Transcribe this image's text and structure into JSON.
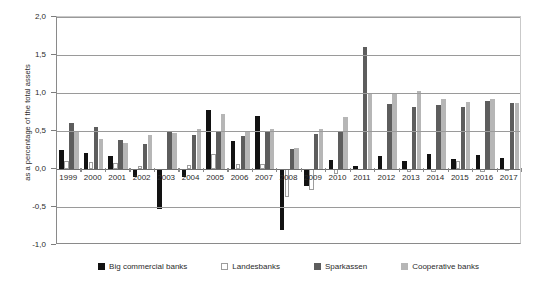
{
  "chart_data": {
    "type": "bar",
    "title": "",
    "subtitle": "",
    "xlabel": "",
    "ylabel": "as a percentage of the total assets",
    "ylim": [
      -1.0,
      2.0
    ],
    "ytick_labels": [
      "2,0",
      "1,5",
      "1,0",
      "0,5",
      "0,0",
      "-0,5",
      "-1,0"
    ],
    "ytick_values": [
      2.0,
      1.5,
      1.0,
      0.5,
      0.0,
      -0.5,
      -1.0
    ],
    "grid": true,
    "legend_position": "bottom",
    "categories": [
      "1999",
      "2000",
      "2001",
      "2002",
      "2003",
      "2004",
      "2005",
      "2006",
      "2007",
      "2008",
      "2009",
      "2010",
      "2011",
      "2012",
      "2013",
      "2014",
      "2015",
      "2016",
      "2017"
    ],
    "series": [
      {
        "name": "Big commercial banks",
        "color": "#121212",
        "values": [
          0.25,
          0.21,
          0.17,
          -0.1,
          -0.52,
          -0.11,
          0.78,
          0.37,
          0.7,
          -0.8,
          -0.22,
          0.12,
          0.04,
          0.17,
          0.1,
          0.2,
          0.13,
          0.18,
          0.15
        ]
      },
      {
        "name": "Landesbanks",
        "color": "#ffffff",
        "values": [
          0.1,
          0.09,
          0.08,
          0.04,
          0.0,
          0.05,
          0.2,
          0.07,
          0.06,
          -0.37,
          -0.27,
          -0.06,
          0.0,
          0.0,
          -0.04,
          -0.04,
          0.1,
          -0.04,
          -0.02
        ]
      },
      {
        "name": "Sparkassen",
        "color": "#5d5d5d",
        "values": [
          0.6,
          0.55,
          0.38,
          0.33,
          0.5,
          0.45,
          0.5,
          0.43,
          0.5,
          0.26,
          0.46,
          0.5,
          1.6,
          0.86,
          0.82,
          0.84,
          0.82,
          0.89,
          0.87
        ]
      },
      {
        "name": "Cooperative banks",
        "color": "#b6b6b6",
        "values": [
          0.5,
          0.4,
          0.34,
          0.45,
          0.47,
          0.52,
          0.72,
          0.5,
          0.53,
          0.28,
          0.52,
          0.68,
          1.0,
          1.0,
          1.02,
          0.92,
          0.88,
          0.92,
          0.87
        ]
      }
    ]
  },
  "legend": {
    "items": [
      {
        "label": "Big commercial banks"
      },
      {
        "label": "Landesbanks"
      },
      {
        "label": "Sparkassen"
      },
      {
        "label": "Cooperative banks"
      }
    ]
  }
}
